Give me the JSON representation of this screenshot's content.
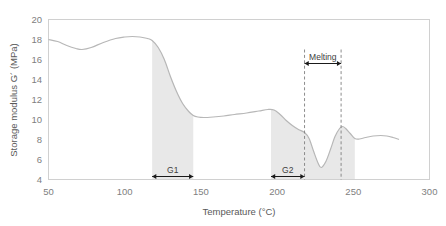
{
  "figure": {
    "top_partial_text": "",
    "background_color": "#ffffff",
    "curve_color": "#b7b7b7",
    "band_color": "#e8e8e8",
    "frame_color": "#d0d0d0"
  },
  "chart_data": {
    "type": "line",
    "title": "",
    "xlabel": "Temperature (°C)",
    "ylabel": "Storage modulus G´ (MPa)",
    "xlim": [
      50,
      300
    ],
    "ylim": [
      4,
      20
    ],
    "xticks": [
      50,
      100,
      150,
      200,
      250,
      300
    ],
    "yticks": [
      4,
      6,
      8,
      10,
      12,
      14,
      16,
      18,
      20
    ],
    "xtick_labels": [
      "50",
      "100",
      "150",
      "200",
      "250",
      "300"
    ],
    "ytick_labels": [
      "4",
      "6",
      "8",
      "10",
      "12",
      "14",
      "16",
      "18",
      "20"
    ],
    "grid": false,
    "legend": null,
    "series": [
      {
        "name": "Storage modulus G'",
        "x": [
          50,
          56,
          62,
          68,
          72,
          78,
          86,
          94,
          100,
          105,
          110,
          115,
          118,
          122,
          126,
          130,
          134,
          138,
          142,
          145,
          148,
          152,
          158,
          165,
          172,
          180,
          188,
          194,
          198,
          202,
          206,
          210,
          214,
          218,
          221,
          224,
          227,
          229,
          232,
          235,
          238,
          241,
          243,
          245,
          248,
          251,
          254,
          258,
          263,
          268,
          272,
          276,
          280
        ],
        "y": [
          18.0,
          17.8,
          17.4,
          17.1,
          17.0,
          17.2,
          17.7,
          18.1,
          18.25,
          18.3,
          18.25,
          18.1,
          17.9,
          17.2,
          16.0,
          14.3,
          12.8,
          11.6,
          10.8,
          10.4,
          10.25,
          10.2,
          10.25,
          10.35,
          10.5,
          10.65,
          10.85,
          11.0,
          10.95,
          10.5,
          9.9,
          9.4,
          9.0,
          8.7,
          8.1,
          6.8,
          5.6,
          5.2,
          5.8,
          7.0,
          8.3,
          9.1,
          9.3,
          9.1,
          8.6,
          8.1,
          8.05,
          8.2,
          8.35,
          8.4,
          8.35,
          8.2,
          8.0
        ]
      }
    ],
    "shaded_regions": [
      {
        "name": "G1",
        "x_start": 118,
        "x_end": 145
      },
      {
        "name": "G2",
        "x_start": 196,
        "x_end": 218
      },
      {
        "name": "Melting",
        "x_start": 218,
        "x_end": 251
      }
    ],
    "vertical_dashed_lines": [
      {
        "x": 218,
        "y_top": 17.0,
        "y_bottom": 4.0
      },
      {
        "x": 242,
        "y_top": 17.0,
        "y_bottom": 4.0
      }
    ],
    "annotations": [
      {
        "label": "G1",
        "x_start": 118,
        "x_end": 145,
        "y": 4.3,
        "style": "double-arrow"
      },
      {
        "label": "G2",
        "x_start": 196,
        "x_end": 218,
        "y": 4.3,
        "style": "double-arrow"
      },
      {
        "label": "Melting",
        "x_start": 218,
        "x_end": 242,
        "y": 15.6,
        "style": "double-arrow"
      }
    ]
  }
}
